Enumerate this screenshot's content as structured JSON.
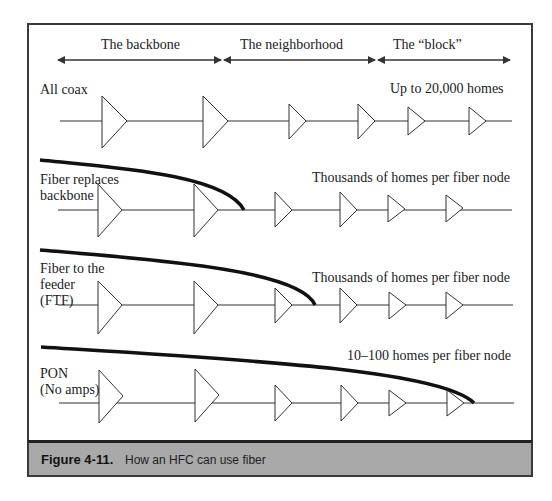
{
  "figure": {
    "number": "Figure 4-11.",
    "caption": "How an HFC can use fiber"
  },
  "sections": [
    {
      "label": "The backbone"
    },
    {
      "label": "The neighborhood"
    },
    {
      "label": "The “block”"
    }
  ],
  "rows": [
    {
      "label_lines": [
        "All coax"
      ],
      "note": "Up to 20,000 homes",
      "fiber": "none"
    },
    {
      "label_lines": [
        "Fiber replaces",
        "backbone"
      ],
      "note": "Thousands of  homes per fiber node",
      "fiber": "backbone"
    },
    {
      "label_lines": [
        "Fiber to the",
        "feeder",
        "(FTF)"
      ],
      "note": "Thousands of  homes per fiber node",
      "fiber": "feeder"
    },
    {
      "label_lines": [
        "PON",
        "(No amps)"
      ],
      "note": "10–100 homes per fiber node",
      "fiber": "pon"
    }
  ],
  "colors": {
    "line": "#333333",
    "fiber": "#111111",
    "caption_bg": "#a9a9a9"
  }
}
